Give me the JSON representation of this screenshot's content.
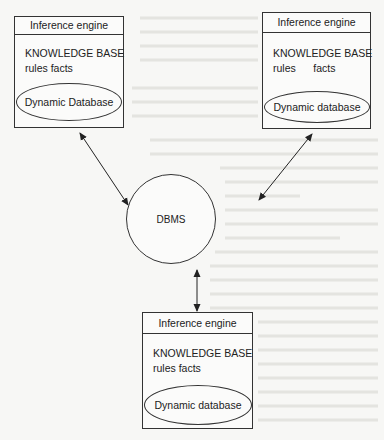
{
  "diagram": {
    "type": "architecture",
    "center": {
      "label": "DBMS"
    },
    "nodes": [
      {
        "id": "left",
        "header": "Inference engine",
        "kb_title": "KNOWLEDGE BASE",
        "kb_items": "rules facts",
        "database": "Dynamic Database"
      },
      {
        "id": "right",
        "header": "Inference engine",
        "kb_title": "KNOWLEDGE BASE",
        "kb_items": "rules      facts",
        "database": "Dynamic database"
      },
      {
        "id": "bottom",
        "header": "Inference engine",
        "kb_title": "KNOWLEDGE BASE",
        "kb_items": "rules facts",
        "database": "Dynamic database"
      }
    ],
    "edges": [
      {
        "from": "left",
        "to": "DBMS",
        "bidirectional": true
      },
      {
        "from": "right",
        "to": "DBMS",
        "bidirectional": true
      },
      {
        "from": "bottom",
        "to": "DBMS",
        "bidirectional": true
      }
    ]
  }
}
